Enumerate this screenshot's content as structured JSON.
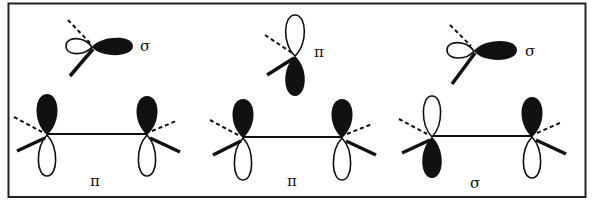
{
  "diagram": {
    "colors": {
      "ink": "#111111",
      "fill": "#111111",
      "background": "#ffffff",
      "border": "#222222"
    },
    "top_row": [
      {
        "id": "top-left",
        "label": "σ",
        "description": "sp-hybrid orbital, large filled lobe pointing right"
      },
      {
        "id": "top-middle",
        "label": "π",
        "description": "p orbital, open lobe up, filled lobe down"
      },
      {
        "id": "top-right",
        "label": "σ",
        "description": "sp-hybrid orbital, large filled lobe pointing right"
      }
    ],
    "bottom_row": [
      {
        "id": "pair-1",
        "label": "π",
        "description": "two p orbitals, both filled lobes up"
      },
      {
        "id": "pair-2",
        "label": "π",
        "description": "two p orbitals, both filled lobes up"
      },
      {
        "id": "pair-3",
        "label": "σ",
        "description": "two p orbitals, left filled down, right filled up"
      }
    ]
  }
}
